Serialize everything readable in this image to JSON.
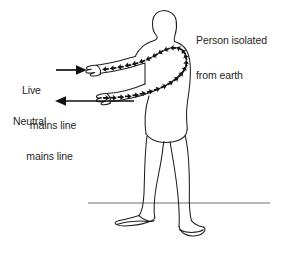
{
  "figure": {
    "background_color": "#ffffff",
    "ink_color": "#1a1a1a",
    "text_color": "#262626",
    "ground_line_color": "#6b6b6b",
    "width": 282,
    "height": 254
  },
  "labels": {
    "person": {
      "line1": "Person isolated",
      "line2": "from earth"
    },
    "live": {
      "line1": "Live",
      "line2": "mains line"
    },
    "neutral": {
      "line1": "Neutral",
      "line2": "mains line"
    }
  },
  "annotations": {
    "live_arrow_direction": "right",
    "neutral_arrow_direction": "left",
    "current_path_description": "Arrow chain from live hand, up the upper arm, across the shoulders, and back down the lower arm to the neutral hand",
    "ground_line_label": "earth / ground level"
  },
  "icons": {
    "live_arrow": "arrow-right-icon",
    "neutral_arrow": "arrow-left-icon",
    "current_flow": "current-flow-arrow-chain-icon",
    "person": "person-outline-icon",
    "ground": "ground-line-icon"
  }
}
